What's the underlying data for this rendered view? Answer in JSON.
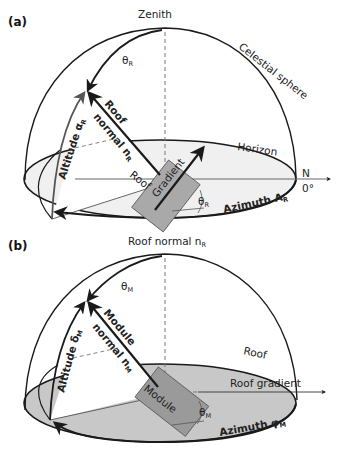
{
  "figure": {
    "panel_a": {
      "panel_label": "(a)",
      "zenith_label": "Zenith",
      "celestial_label": "Celestial sphere",
      "horizon_label": "Horizon",
      "north_label": "N",
      "zero_deg_label": "0°",
      "theta_label": "θ",
      "theta_sub": "R",
      "normal_line1": "Roof",
      "normal_line2": "normal n",
      "normal_sub": "R",
      "altitude_label": "Altitude α",
      "altitude_sub": "R",
      "azimuth_label": "Azimuth A",
      "azimuth_sub": "R",
      "plate_label_left": "Roof",
      "plate_label_right": "Gradient",
      "plate_angle_label": "θ",
      "plate_angle_sub": "R",
      "ground_fill": "#f0f0f0",
      "plate_fill": "#a9a9a9"
    },
    "panel_b": {
      "panel_label": "(b)",
      "top_label": "Roof normal n",
      "top_sub": "R",
      "theta_label": "θ",
      "theta_sub": "M",
      "normal_line1": "Module",
      "normal_line2": "normal n",
      "normal_sub": "M",
      "altitude_label": "Altitude δ",
      "altitude_sub": "M",
      "roof_label": "Roof",
      "roof_gradient_label": "Roof gradient",
      "azimuth_label": "Azimuth φ",
      "azimuth_sub": "M",
      "plate_label": "Module",
      "plate_angle_label": "θ",
      "plate_angle_sub": "M",
      "ground_fill": "#c8c8c8",
      "plate_fill": "#9a9a9a"
    },
    "colors": {
      "line": "#1a1a1a",
      "gray_arrow": "#555555",
      "dashed": "#777777"
    }
  }
}
